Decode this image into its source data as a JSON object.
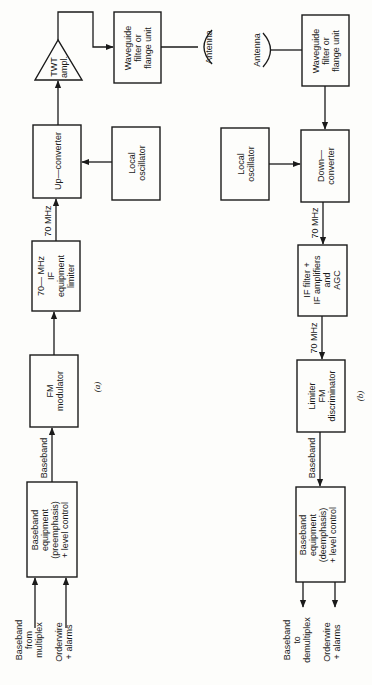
{
  "figure": {
    "orientation": "rotated-90-clockwise",
    "panel_a": {
      "caption": "(a)",
      "title": "Transmitter",
      "blocks": {
        "baseband_equipment": [
          "Baseband",
          "equipment",
          "(preemphasis)",
          "+ level  control"
        ],
        "fm_modulator": [
          "FM",
          "modulator"
        ],
        "if_equipment": [
          "70— MHz",
          "IF",
          "equipment",
          "limiter"
        ],
        "up_converter": [
          "Up—converter"
        ],
        "local_oscillator": [
          "Local",
          "oscillator"
        ],
        "twt_amplifier": [
          "TWT",
          "ampl."
        ],
        "waveguide_filter": [
          "Waveguide",
          "filter or",
          "flange unit"
        ],
        "antenna": "Antenna"
      },
      "inputs": {
        "baseband_from_multiplex": [
          "Baseband",
          "from",
          "multiplex"
        ],
        "orderwire_alarms": [
          "Orderwire",
          "+ alarms"
        ]
      },
      "link_labels": {
        "baseband": "Baseband",
        "if_70mhz": "70 MHz"
      }
    },
    "panel_b": {
      "caption": "(b)",
      "title": "Receiver",
      "blocks": {
        "antenna": "Antenna",
        "waveguide_filter": [
          "Waveguide",
          "filter or",
          "flange unit"
        ],
        "local_oscillator": [
          "Local",
          "oscillator"
        ],
        "down_converter": [
          "Down—",
          "converter"
        ],
        "if_filter_amplifiers": [
          "IF filter +",
          "IF amplifiers",
          "and",
          "AGC"
        ],
        "limiter_fm_discriminator": [
          "Limiter",
          "FM",
          "discriminator"
        ],
        "baseband_equipment": [
          "Baseband",
          "equipment",
          "(deemphasis)",
          "+ level  control"
        ]
      },
      "outputs": {
        "baseband_to_demultiplex": [
          "Baseband",
          "to",
          "demultiplex"
        ],
        "orderwire_alarms": [
          "Orderwire",
          "+ alarms"
        ]
      },
      "link_labels": {
        "if_70mhz_1": "70 MHz",
        "if_70mhz_2": "70 MHz",
        "baseband": "Baseband"
      }
    }
  }
}
